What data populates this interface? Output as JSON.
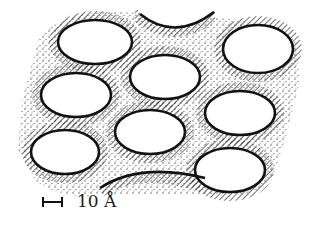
{
  "diagram": {
    "type": "porous-lattice-schematic",
    "pore_count_full": 9,
    "pore_count_partial": 2,
    "scale_bar": {
      "label": "10 Å"
    },
    "colors": {
      "outline": "#111111",
      "hatch": "#333333",
      "stipple": "#444444",
      "background": "#ffffff"
    }
  }
}
